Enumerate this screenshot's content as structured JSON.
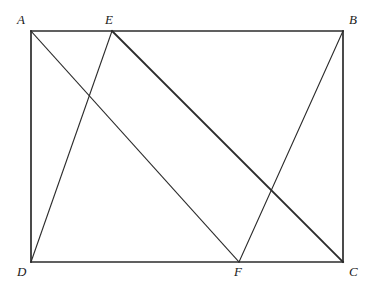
{
  "figure": {
    "background_color": "#ffffff",
    "stroke_color": "#2b2b2b",
    "canvas": {
      "width": 371,
      "height": 289
    }
  },
  "points": {
    "A": {
      "label": "A",
      "x": 31,
      "y": 31,
      "label_x": 17,
      "label_y": 13
    },
    "B": {
      "label": "B",
      "x": 343,
      "y": 31,
      "label_x": 349,
      "label_y": 13
    },
    "C": {
      "label": "C",
      "x": 343,
      "y": 262,
      "label_x": 349,
      "label_y": 265
    },
    "D": {
      "label": "D",
      "x": 31,
      "y": 262,
      "label_x": 17,
      "label_y": 265
    },
    "E": {
      "label": "E",
      "x": 112,
      "y": 31,
      "label_x": 105,
      "label_y": 13
    },
    "F": {
      "label": "F",
      "x": 239,
      "y": 262,
      "label_x": 234,
      "label_y": 265
    }
  },
  "segments": [
    {
      "name": "side-AB",
      "from": "A",
      "to": "B",
      "x1": 31,
      "y1": 31,
      "x2": 343,
      "y2": 31,
      "width": 1.7
    },
    {
      "name": "side-BC",
      "from": "B",
      "to": "C",
      "x1": 343,
      "y1": 31,
      "x2": 343,
      "y2": 262,
      "width": 1.7
    },
    {
      "name": "side-CD",
      "from": "C",
      "to": "D",
      "x1": 343,
      "y1": 262,
      "x2": 31,
      "y2": 262,
      "width": 1.7
    },
    {
      "name": "side-DA",
      "from": "D",
      "to": "A",
      "x1": 31,
      "y1": 262,
      "x2": 31,
      "y2": 31,
      "width": 1.7
    },
    {
      "name": "segment-AF",
      "from": "A",
      "to": "F",
      "x1": 31,
      "y1": 31,
      "x2": 239,
      "y2": 262,
      "width": 1.1
    },
    {
      "name": "segment-ED",
      "from": "E",
      "to": "D",
      "x1": 112,
      "y1": 31,
      "x2": 31,
      "y2": 262,
      "width": 1.1
    },
    {
      "name": "segment-EC",
      "from": "E",
      "to": "C",
      "x1": 112,
      "y1": 31,
      "x2": 343,
      "y2": 262,
      "width": 1.9
    },
    {
      "name": "segment-BF",
      "from": "B",
      "to": "F",
      "x1": 343,
      "y1": 31,
      "x2": 239,
      "y2": 262,
      "width": 1.1
    }
  ]
}
